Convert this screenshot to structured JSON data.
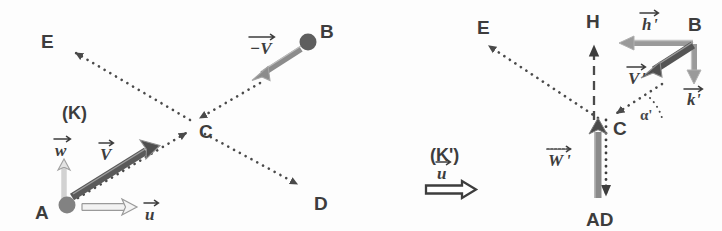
{
  "figure": {
    "width": 722,
    "height": 231,
    "background": "#fdfdfd"
  },
  "colors": {
    "ink": "#3d3d3d",
    "dotted_path": "#4a4a4a",
    "dark_vector": "#555555",
    "mid_vector": "#8a8a8a",
    "light_vector": "#b9b9b9",
    "outline": "#9a9a9a",
    "node_fill": "#808080"
  },
  "panels": [
    {
      "id": "left",
      "frame_label": "(K)",
      "frame_label_pos": {
        "x": 72,
        "y": 118
      },
      "points": [
        {
          "name": "A",
          "label": "A",
          "label_x": 38,
          "label_y": 219,
          "x": 67,
          "y": 205,
          "node": true
        },
        {
          "name": "B",
          "label": "B",
          "label_x": 318,
          "label_y": 37,
          "x": 308,
          "y": 42,
          "node": true
        },
        {
          "name": "C",
          "label": "C",
          "label_x": 197,
          "label_y": 137,
          "x": 194,
          "y": 128,
          "node": false
        },
        {
          "name": "D",
          "label": "D",
          "label_x": 316,
          "label_y": 209,
          "x": 303,
          "y": 188,
          "node": false
        },
        {
          "name": "E",
          "label": "E",
          "label_x": 41,
          "label_y": 48,
          "x": 70,
          "y": 50,
          "node": false
        }
      ],
      "paths": [
        {
          "name": "path-a-to-c",
          "from": "A",
          "to": "C",
          "style": "dotted",
          "arrow": "end"
        },
        {
          "name": "path-c-to-d",
          "from": "C",
          "to": "D",
          "style": "dotted",
          "arrow": "end"
        },
        {
          "name": "path-b-to-c",
          "from": "B",
          "to": "C",
          "style": "dotted",
          "arrow": "end"
        },
        {
          "name": "path-c-to-e",
          "from": "C",
          "to": "E",
          "style": "dotted",
          "arrow": "end"
        }
      ],
      "vectors": [
        {
          "name": "vector-v",
          "label": "V",
          "accent": "arrow",
          "prime": false,
          "label_x": 104,
          "label_y": 158,
          "x1": 71,
          "y1": 198,
          "x2": 152,
          "y2": 148,
          "tone": "dark_vector"
        },
        {
          "name": "vector-w",
          "label": "w",
          "accent": "arrow",
          "prime": false,
          "label_x": 58,
          "label_y": 154,
          "x1": 64,
          "y1": 198,
          "x2": 64,
          "y2": 161,
          "tone": "light_vector"
        },
        {
          "name": "vector-u",
          "label": "u",
          "accent": "arrow",
          "prime": false,
          "label_x": 148,
          "label_y": 218,
          "x1": 81,
          "y1": 207,
          "x2": 133,
          "y2": 207,
          "tone": "light_vector"
        },
        {
          "name": "vector-minus-v",
          "label": "−V",
          "accent": "arrow",
          "prime": false,
          "label_x": 253,
          "label_y": 52,
          "x1": 302,
          "y1": 48,
          "x2": 253,
          "y2": 79,
          "tone": "mid_vector"
        }
      ]
    },
    {
      "id": "right",
      "frame_label": "(K')",
      "frame_label_pos": {
        "x": 436,
        "y": 160
      },
      "points": [
        {
          "name": "AD",
          "label": "AD",
          "label_x": 591,
          "label_y": 225,
          "x": 606,
          "y": 200,
          "node": false
        },
        {
          "name": "B",
          "label": "B",
          "label_x": 690,
          "label_y": 30,
          "x": 694,
          "y": 43,
          "node": false
        },
        {
          "name": "C",
          "label": "C",
          "label_x": 613,
          "label_y": 133,
          "x": 606,
          "y": 122,
          "node": false
        },
        {
          "name": "E",
          "label": "E",
          "label_x": 479,
          "label_y": 33,
          "x": 483,
          "y": 43,
          "node": false
        },
        {
          "name": "H",
          "label": "H",
          "label_x": 587,
          "label_y": 27,
          "x": 594,
          "y": 38,
          "node": false
        }
      ],
      "paths": [
        {
          "name": "path-c-to-e",
          "from": "C",
          "to": "E",
          "style": "dotted",
          "arrow": "end"
        },
        {
          "name": "path-b-to-c",
          "from": "B",
          "to": "C",
          "style": "dotted",
          "arrow": "end"
        },
        {
          "name": "path-ad-to-h",
          "from": "AD",
          "to": "H",
          "style": "dashed",
          "arrow": "end"
        },
        {
          "name": "path-c-to-ad",
          "from": "C",
          "to": "AD",
          "style": "dotted",
          "arrow": "end"
        }
      ],
      "vectors": [
        {
          "name": "vector-v-prime",
          "label": "V",
          "accent": "arrow",
          "prime": true,
          "label_x": 634,
          "label_y": 82,
          "x1": 694,
          "y1": 45,
          "x2": 644,
          "y2": 76,
          "tone": "dark_vector"
        },
        {
          "name": "vector-h-prime",
          "label": "h",
          "accent": "arrow",
          "prime": true,
          "label_x": 645,
          "label_y": 28,
          "x1": 692,
          "y1": 43,
          "x2": 625,
          "y2": 43,
          "tone": "mid_vector"
        },
        {
          "name": "vector-k-prime",
          "label": "k",
          "accent": "arrow",
          "prime": true,
          "label_x": 689,
          "label_y": 103,
          "x1": 694,
          "y1": 45,
          "x2": 694,
          "y2": 78,
          "tone": "mid_vector"
        },
        {
          "name": "vector-w-prime",
          "label": "W",
          "accent": "arrow",
          "prime": true,
          "label_x": 555,
          "label_y": 164,
          "x1": 598,
          "y1": 198,
          "x2": 598,
          "y2": 124,
          "tone": "mid_vector"
        },
        {
          "name": "vector-u-frame",
          "label": "u",
          "accent": "arrow",
          "prime": false,
          "label_x": 441,
          "label_y": 177,
          "x1": 425,
          "y1": 190,
          "x2": 473,
          "y2": 190,
          "tone": "double"
        }
      ],
      "angle": {
        "name": "angle-alpha-prime",
        "label": "α'",
        "label_x": 644,
        "label_y": 117,
        "cx": 606,
        "cy": 122,
        "r": 44,
        "start_deg": -32,
        "end_deg": 0
      }
    }
  ]
}
